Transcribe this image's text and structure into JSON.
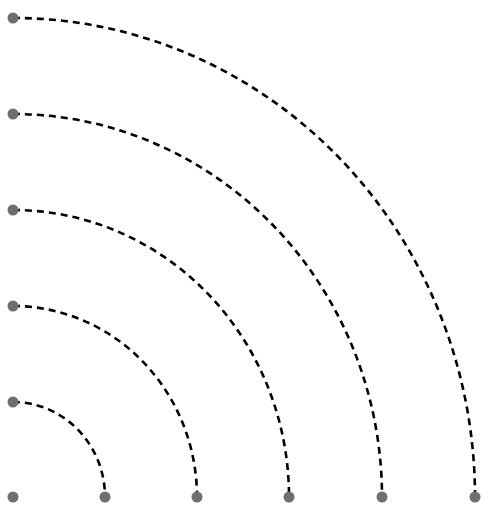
{
  "diagram": {
    "type": "concentric-quarter-arcs",
    "origin": {
      "x": 13,
      "y": 497
    },
    "dot_color": "#6f6f6f",
    "dot_radius": 5.5,
    "arc_color": "#000000",
    "arc_style": "dashed",
    "arcs": [
      {
        "id": 1,
        "start": {
          "x": 13,
          "y": 402
        },
        "end": {
          "x": 105,
          "y": 497
        }
      },
      {
        "id": 2,
        "start": {
          "x": 13,
          "y": 306
        },
        "end": {
          "x": 197,
          "y": 497
        }
      },
      {
        "id": 3,
        "start": {
          "x": 13,
          "y": 210
        },
        "end": {
          "x": 289,
          "y": 497
        }
      },
      {
        "id": 4,
        "start": {
          "x": 13,
          "y": 114
        },
        "end": {
          "x": 382,
          "y": 497
        }
      },
      {
        "id": 5,
        "start": {
          "x": 13,
          "y": 18
        },
        "end": {
          "x": 475,
          "y": 497
        }
      }
    ]
  }
}
